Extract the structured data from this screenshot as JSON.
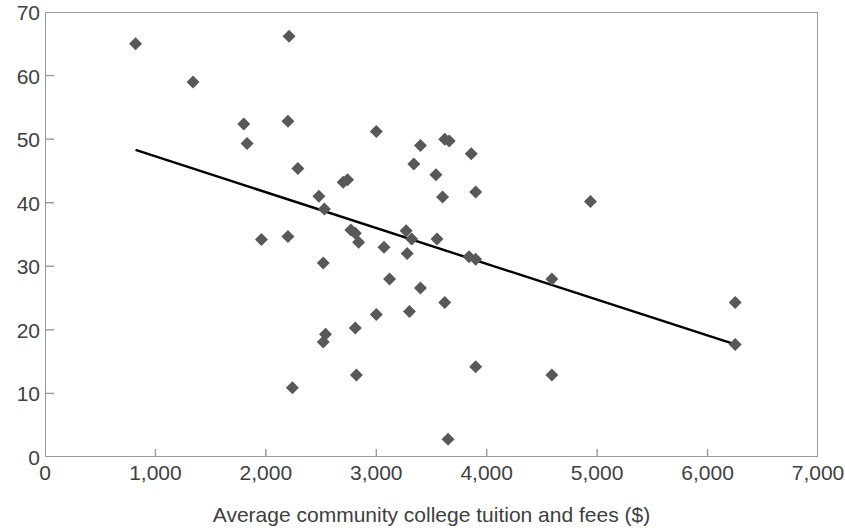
{
  "chart_data": {
    "type": "scatter",
    "title": "",
    "xlabel": "Average community college tuition and fees ($)",
    "ylabel": "",
    "xlim": [
      0,
      7000
    ],
    "ylim": [
      0,
      70
    ],
    "grid": false,
    "legend": "none",
    "marker": {
      "shape": "diamond",
      "color": "#585858",
      "size": 13
    },
    "xticks": [
      0,
      1000,
      2000,
      3000,
      4000,
      5000,
      6000,
      7000
    ],
    "xtick_labels": [
      "0",
      "1,000",
      "2,000",
      "3,000",
      "4,000",
      "5,000",
      "6,000",
      "7,000"
    ],
    "yticks": [
      0,
      10,
      20,
      30,
      40,
      50,
      60,
      70
    ],
    "ytick_labels": [
      "0",
      "10",
      "20",
      "30",
      "40",
      "50",
      "60",
      "70"
    ],
    "points": [
      {
        "x": 820,
        "y": 65.0
      },
      {
        "x": 1340,
        "y": 59.0
      },
      {
        "x": 2210,
        "y": 66.2
      },
      {
        "x": 1800,
        "y": 52.4
      },
      {
        "x": 1830,
        "y": 49.3
      },
      {
        "x": 2200,
        "y": 52.8
      },
      {
        "x": 2290,
        "y": 45.4
      },
      {
        "x": 3000,
        "y": 51.2
      },
      {
        "x": 3400,
        "y": 49.0
      },
      {
        "x": 3620,
        "y": 50.0
      },
      {
        "x": 3660,
        "y": 49.7
      },
      {
        "x": 3860,
        "y": 47.7
      },
      {
        "x": 3340,
        "y": 46.1
      },
      {
        "x": 3540,
        "y": 44.4
      },
      {
        "x": 2480,
        "y": 41.0
      },
      {
        "x": 2530,
        "y": 39.0
      },
      {
        "x": 2740,
        "y": 43.6
      },
      {
        "x": 2700,
        "y": 43.2
      },
      {
        "x": 3600,
        "y": 40.9
      },
      {
        "x": 3900,
        "y": 41.7
      },
      {
        "x": 4940,
        "y": 40.2
      },
      {
        "x": 1960,
        "y": 34.2
      },
      {
        "x": 2200,
        "y": 34.7
      },
      {
        "x": 2770,
        "y": 35.7
      },
      {
        "x": 2810,
        "y": 35.2
      },
      {
        "x": 2840,
        "y": 33.8
      },
      {
        "x": 3070,
        "y": 33.0
      },
      {
        "x": 3270,
        "y": 35.6
      },
      {
        "x": 3320,
        "y": 34.3
      },
      {
        "x": 3280,
        "y": 32.0
      },
      {
        "x": 3550,
        "y": 34.3
      },
      {
        "x": 3840,
        "y": 31.5
      },
      {
        "x": 3900,
        "y": 31.1
      },
      {
        "x": 2520,
        "y": 30.5
      },
      {
        "x": 3120,
        "y": 28.0
      },
      {
        "x": 3400,
        "y": 26.6
      },
      {
        "x": 3300,
        "y": 22.9
      },
      {
        "x": 3620,
        "y": 24.3
      },
      {
        "x": 3000,
        "y": 22.4
      },
      {
        "x": 4590,
        "y": 28.0
      },
      {
        "x": 6250,
        "y": 24.3
      },
      {
        "x": 6250,
        "y": 17.7
      },
      {
        "x": 2540,
        "y": 19.3
      },
      {
        "x": 2520,
        "y": 18.1
      },
      {
        "x": 2810,
        "y": 20.3
      },
      {
        "x": 2820,
        "y": 12.9
      },
      {
        "x": 2240,
        "y": 10.9
      },
      {
        "x": 3900,
        "y": 14.2
      },
      {
        "x": 4590,
        "y": 12.9
      },
      {
        "x": 3650,
        "y": 2.8
      }
    ],
    "trendline": {
      "type": "linear",
      "color": "#000000",
      "width": 2.4,
      "x_start": 820,
      "y_start": 48.3,
      "x_end": 6250,
      "y_end": 17.7
    }
  },
  "axes": {
    "frame_color": "#9a9a9a",
    "tick_color": "#9a9a9a",
    "label_color": "#404040"
  }
}
